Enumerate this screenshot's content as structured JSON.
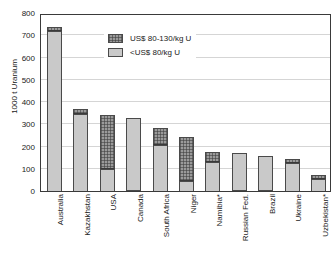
{
  "chart_data": {
    "type": "bar",
    "title": "",
    "subtitle": "",
    "xlabel": "",
    "ylabel": "1000 t Uranium",
    "ylim": [
      0,
      800
    ],
    "ytick_step": 100,
    "yticks": [
      "800",
      "700",
      "600",
      "500",
      "400",
      "300",
      "200",
      "100",
      "0"
    ],
    "grid": true,
    "stacked": true,
    "legend_position": "inside-top-center",
    "categories": [
      "Australia",
      "Kazakhstan",
      "USA",
      "Canada",
      "South Africa",
      "Niger",
      "Namibia*",
      "Russian Fed.",
      "Brazil",
      "Ukraine",
      "Uzbekistan*"
    ],
    "series": [
      {
        "name": "<US$ 80/kg U",
        "color": "#c9c9c9",
        "pattern": "solid",
        "values": [
          720,
          344,
          100,
          329,
          205,
          45,
          130,
          172,
          157,
          128,
          55
        ]
      },
      {
        "name": "US$ 80-130/kg U",
        "color": "#9a9a9a",
        "pattern": "stipple",
        "values": [
          16,
          24,
          240,
          0,
          80,
          200,
          45,
          0,
          0,
          15,
          17
        ]
      }
    ],
    "totals": [
      736,
      368,
      340,
      329,
      285,
      245,
      175,
      172,
      157,
      143,
      72
    ]
  },
  "legend": {
    "items": [
      {
        "label": "US$ 80-130/kg U",
        "swatch": "stipple-swatch"
      },
      {
        "label": "<US$ 80/kg U",
        "swatch": "solid-gray-swatch"
      }
    ]
  },
  "axes": {
    "y_title": "1000 t Uranium"
  }
}
